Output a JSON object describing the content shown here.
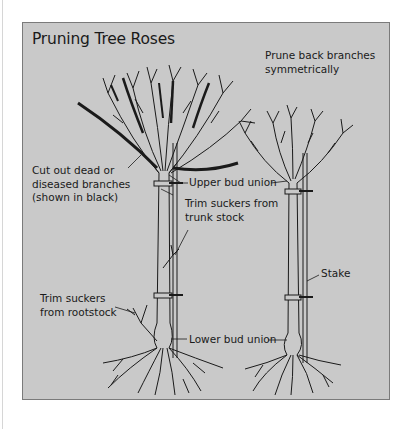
{
  "diagram": {
    "title": "Pruning Tree Roses",
    "colors": {
      "panel_background": "#c9c9c9",
      "panel_border": "#7a7a7a",
      "ink": "#1a1a1a",
      "page_background": "#ffffff"
    },
    "trees": [
      {
        "id": "unpruned-tree",
        "description": "Tree rose before pruning, dead/diseased branches shown in black"
      },
      {
        "id": "pruned-tree",
        "description": "Tree rose after symmetrical pruning, tied to stake"
      }
    ],
    "labels": {
      "prune_back": {
        "line1": "Prune back branches",
        "line2": "symmetrically"
      },
      "cut_out_dead": {
        "line1": "Cut out dead or",
        "line2": "diseased branches",
        "line3": "(shown in black)"
      },
      "upper_bud_union": {
        "line1": "Upper bud union"
      },
      "trim_trunk": {
        "line1": "Trim suckers from",
        "line2": "trunk stock"
      },
      "stake": {
        "line1": "Stake"
      },
      "trim_rootstock": {
        "line1": "Trim suckers",
        "line2": "from rootstock"
      },
      "lower_bud_union": {
        "line1": "Lower bud union"
      }
    }
  }
}
